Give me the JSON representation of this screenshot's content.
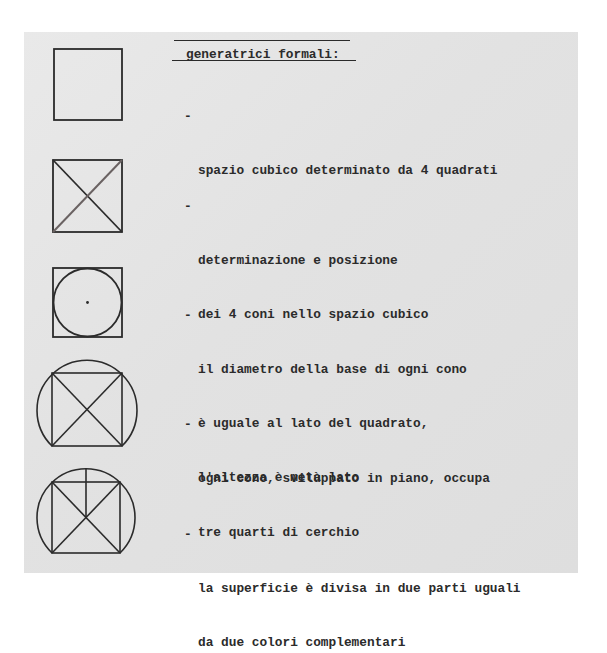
{
  "document": {
    "heading": "generatrici formali:",
    "bullet_glyph": "-",
    "items": [
      {
        "figure": "square-icon",
        "lines": [
          "spazio cubico determinato da 4 quadrati"
        ]
      },
      {
        "figure": "square-with-diagonals-icon",
        "lines": [
          "determinazione e posizione",
          "dei 4 coni nello spazio cubico"
        ]
      },
      {
        "figure": "circle-inscribed-in-square-icon",
        "lines": [
          "il diametro della base di ogni cono",
          "è uguale al lato del quadrato,",
          "l'altezza è metà lato"
        ]
      },
      {
        "figure": "three-quarter-circle-around-square-icon",
        "lines": [
          "ogni cono, sviluppato in piano, occupa",
          "tre quarti di cerchio"
        ]
      },
      {
        "figure": "divided-circle-square-icon",
        "lines": [
          "la superficie è divisa in due parti uguali",
          "da due colori complementari"
        ]
      }
    ]
  },
  "colors": {
    "paper": "#e4e4e4",
    "ink": "#2b2b2b",
    "diagonal_light": "#6a6262"
  }
}
